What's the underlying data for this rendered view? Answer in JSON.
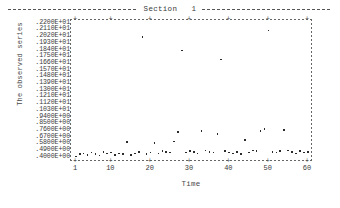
{
  "chart_data": {
    "type": "scatter",
    "title": "Section   1",
    "xlabel": "Time",
    "ylabel": "The observed series",
    "xlim": [
      1,
      60
    ],
    "ylim": [
      0.4,
      2.2
    ],
    "grid": false,
    "legend": null,
    "ytick_labels": [
      ".2200E+01",
      ".2110E+01",
      ".2020E+01",
      ".1930E+01",
      ".1840E+01",
      ".1750E+01",
      ".1660E+01",
      ".1570E+01",
      ".1480E+01",
      ".1390E+01",
      ".1300E+01",
      ".1210E+01",
      ".1120E+01",
      ".1030E+01",
      ".9400E+00",
      ".8500E+00",
      ".7600E+00",
      ".6700E+00",
      ".5800E+00",
      ".4900E+00",
      ".4000E+00"
    ],
    "ytick_values": [
      2.2,
      2.11,
      2.02,
      1.93,
      1.84,
      1.75,
      1.66,
      1.57,
      1.48,
      1.39,
      1.3,
      1.21,
      1.12,
      1.03,
      0.94,
      0.85,
      0.76,
      0.67,
      0.58,
      0.49,
      0.4
    ],
    "xtick_labels": [
      "1",
      "10",
      "20",
      "30",
      "40",
      "50",
      "60"
    ],
    "xtick_values": [
      1,
      10,
      20,
      30,
      40,
      50,
      60
    ],
    "x": [
      1,
      2,
      3,
      4,
      5,
      6,
      7,
      8,
      9,
      10,
      11,
      12,
      13,
      14,
      15,
      16,
      17,
      18,
      19,
      20,
      21,
      22,
      23,
      24,
      25,
      26,
      27,
      28,
      29,
      30,
      31,
      32,
      33,
      34,
      35,
      36,
      37,
      38,
      39,
      40,
      41,
      42,
      43,
      44,
      45,
      46,
      47,
      48,
      49,
      50,
      51,
      52,
      53,
      54,
      55,
      56,
      57,
      58,
      59,
      60
    ],
    "values": [
      0.42,
      0.45,
      0.46,
      0.44,
      0.47,
      0.45,
      0.43,
      0.48,
      0.46,
      0.47,
      0.44,
      0.46,
      0.45,
      0.61,
      0.44,
      0.46,
      0.48,
      2.02,
      0.45,
      0.47,
      0.6,
      0.46,
      0.49,
      0.48,
      0.47,
      0.62,
      0.75,
      1.84,
      0.47,
      0.49,
      0.48,
      0.46,
      0.76,
      0.5,
      0.48,
      0.47,
      0.72,
      1.72,
      0.49,
      0.47,
      0.46,
      0.48,
      0.45,
      0.64,
      0.47,
      0.5,
      0.49,
      0.76,
      0.79,
      2.11,
      0.48,
      0.47,
      0.49,
      0.77,
      0.5,
      0.48,
      0.46,
      0.49,
      0.47,
      0.48
    ]
  }
}
